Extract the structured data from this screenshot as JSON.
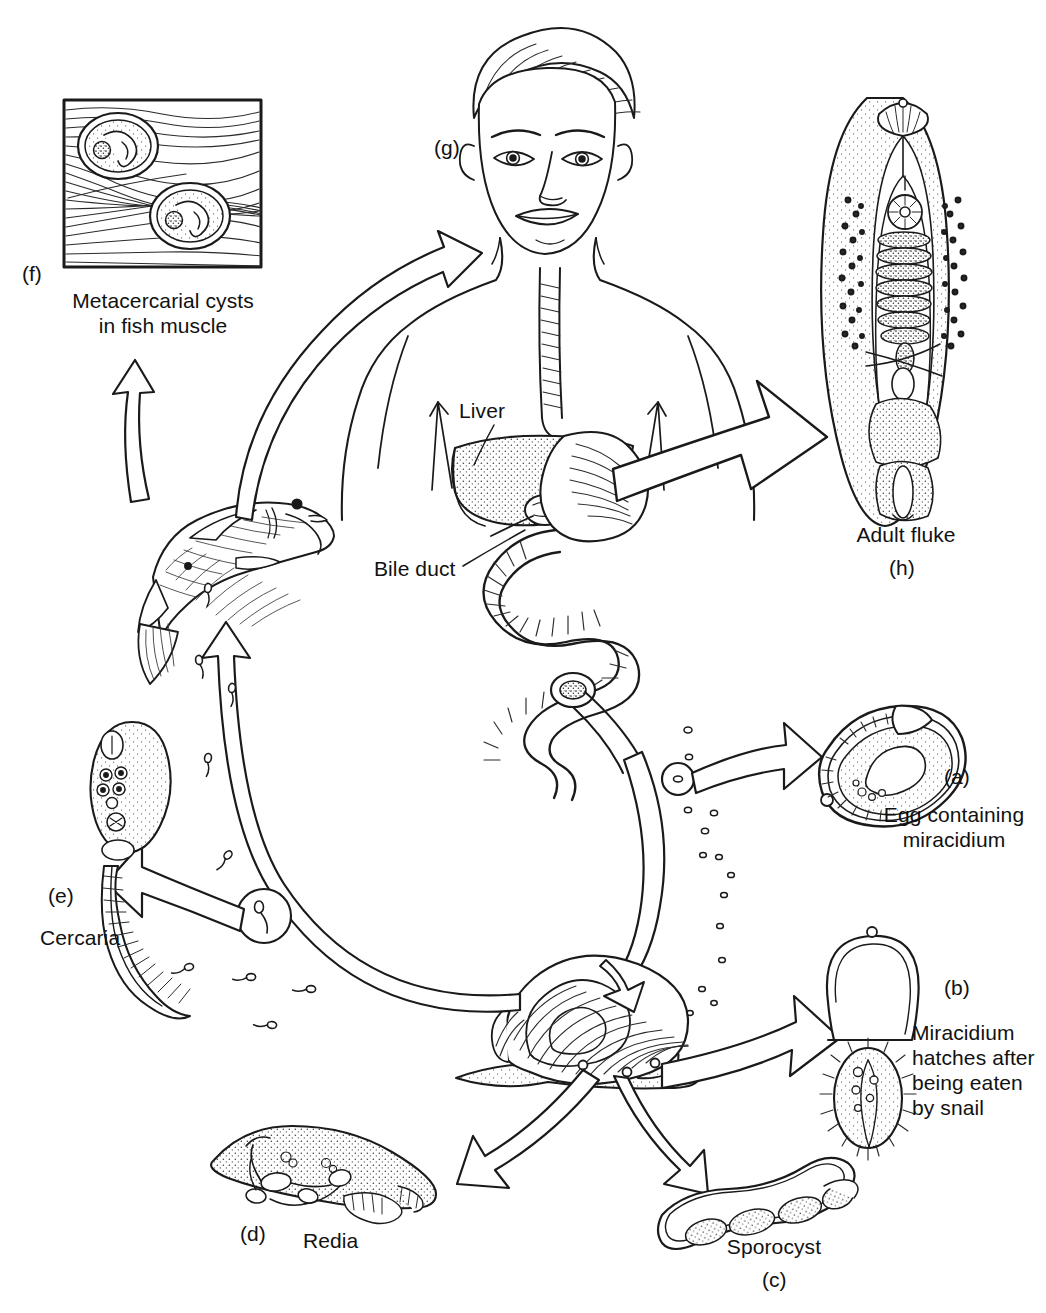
{
  "figure": {
    "background_color": "#ffffff",
    "ink_color": "#1a1a1a"
  },
  "stages": [
    {
      "key": "a",
      "tag": "(a)",
      "caption": "Egg containing\nmiracidium",
      "caption_line1": "Egg containing",
      "caption_line2": "miracidium",
      "organism": "egg"
    },
    {
      "key": "b",
      "tag": "(b)",
      "caption": "Miracidium\nhatches after\nbeing eaten\nby snail",
      "caption_line1": "Miracidium",
      "caption_line2": "hatches after",
      "caption_line3": "being eaten",
      "caption_line4": "by snail",
      "organism": "miracidium"
    },
    {
      "key": "c",
      "tag": "(c)",
      "caption": "Sporocyst",
      "organism": "sporocyst"
    },
    {
      "key": "d",
      "tag": "(d)",
      "caption": "Redia",
      "organism": "redia"
    },
    {
      "key": "e",
      "tag": "(e)",
      "caption": "Cercaria",
      "organism": "cercaria"
    },
    {
      "key": "f",
      "tag": "(f)",
      "caption": "Metacercarial cysts\nin fish muscle",
      "caption_line1": "Metacercarial cysts",
      "caption_line2": "in fish muscle",
      "organism": "metacercarial-cysts"
    },
    {
      "key": "g",
      "tag": "(g)",
      "caption": "",
      "organism": "human-host"
    },
    {
      "key": "h",
      "tag": "(h)",
      "caption": "Adult fluke",
      "organism": "adult-fluke"
    }
  ],
  "anatomy_labels": [
    {
      "name": "liver",
      "text": "Liver"
    },
    {
      "name": "bile-duct",
      "text": "Bile duct"
    }
  ],
  "labels": {
    "tag_a": "(a)",
    "tag_b": "(b)",
    "tag_c": "(c)",
    "tag_d": "(d)",
    "tag_e": "(e)",
    "tag_f": "(f)",
    "tag_g": "(g)",
    "tag_h": "(h)",
    "egg_line1": "Egg containing",
    "egg_line2": "miracidium",
    "miracidium_line1": "Miracidium",
    "miracidium_line2": "hatches after",
    "miracidium_line3": "being eaten",
    "miracidium_line4": "by snail",
    "sporocyst": "Sporocyst",
    "redia": "Redia",
    "cercaria": "Cercaria",
    "cysts_line1": "Metacercarial cysts",
    "cysts_line2": "in fish muscle",
    "adult_fluke": "Adult fluke",
    "liver": "Liver",
    "bile_duct": "Bile duct"
  }
}
